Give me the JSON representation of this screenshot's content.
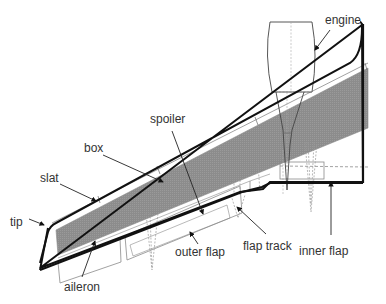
{
  "diagram": {
    "colors": {
      "outline": "#111111",
      "thin_line": "#8a8a8a",
      "box_fill": "#8c8c8c",
      "label_text": "#333333",
      "background": "#ffffff"
    },
    "labels": {
      "engine": "engine",
      "spoiler": "spoiler",
      "box": "box",
      "slat": "slat",
      "tip": "tip",
      "aileron": "aileron",
      "outer_flap": "outer flap",
      "flap_track": "flap track",
      "inner_flap": "inner flap"
    }
  }
}
